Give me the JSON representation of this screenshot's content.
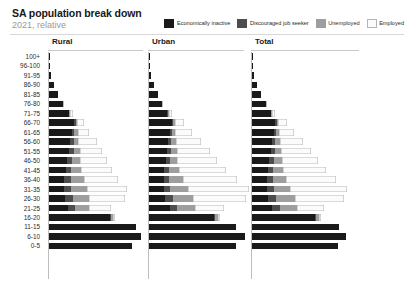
{
  "header": {
    "title": "SA population break down",
    "subtitle": "2021, relative"
  },
  "legend": {
    "items": [
      {
        "label": "Economically inactive",
        "color": "#1a1a1a",
        "icon": "legend-swatch-icon"
      },
      {
        "label": "Discouraged job seeker",
        "color": "#4d4d4d",
        "icon": "legend-swatch-icon"
      },
      {
        "label": "Unemployed",
        "color": "#9e9e9e",
        "icon": "legend-swatch-icon"
      },
      {
        "label": "Employed",
        "color": "#fbfbfb",
        "icon": "legend-swatch-icon"
      }
    ]
  },
  "panels": [
    {
      "key": "rural",
      "title": "Rural"
    },
    {
      "key": "urban",
      "title": "Urban"
    },
    {
      "key": "total",
      "title": "Total"
    }
  ],
  "chart_data": {
    "type": "bar",
    "subtype": "stacked-horizontal-population-pyramid",
    "title": "SA population break down",
    "subtitle": "2021, relative",
    "xlabel": "",
    "ylabel": "",
    "grid": false,
    "legend_position": "top-right",
    "stack_order": [
      "Economically inactive",
      "Discouraged job seeker",
      "Unemployed",
      "Employed"
    ],
    "series_colors": [
      "#1a1a1a",
      "#4d4d4d",
      "#9e9e9e",
      "#fbfbfb"
    ],
    "categories": [
      "100+",
      "96-100",
      "91-95",
      "86-90",
      "81-85",
      "76-80",
      "71-75",
      "66-70",
      "61-65",
      "56-60",
      "51-55",
      "46-50",
      "41-45",
      "36-40",
      "31-35",
      "26-30",
      "21-25",
      "16-20",
      "11-15",
      "6-10",
      "0-5"
    ],
    "panels": [
      {
        "name": "Rural",
        "values": {
          "Economically inactive": [
            0.4,
            0.6,
            1.2,
            3.2,
            5.6,
            8.6,
            12.2,
            15.6,
            14.2,
            13.2,
            12.6,
            11.4,
            10.2,
            9.4,
            9.2,
            9.6,
            11.8,
            37.4,
            54.0,
            56.6,
            51.0
          ],
          "Discouraged job seeker": [
            0,
            0,
            0,
            0,
            0,
            0,
            0.4,
            0.8,
            1.4,
            2.0,
            2.6,
            3.0,
            3.4,
            4.0,
            4.6,
            5.0,
            4.2,
            0.8,
            0,
            0,
            0
          ],
          "Unemployed": [
            0,
            0,
            0,
            0,
            0,
            0,
            0.4,
            1.0,
            2.0,
            3.0,
            4.0,
            5.0,
            6.4,
            8.0,
            9.4,
            10.2,
            9.0,
            1.4,
            0,
            0,
            0
          ],
          "Employed": [
            0,
            0,
            0,
            0,
            0,
            0.4,
            1.6,
            4.2,
            7.4,
            11.4,
            13.4,
            16.6,
            19.2,
            21.4,
            25.0,
            22.4,
            13.0,
            1.0,
            0,
            0,
            0
          ]
        }
      },
      {
        "name": "Urban",
        "values": {
          "Economically inactive": [
            0.4,
            0.6,
            1.2,
            3.0,
            5.4,
            8.2,
            11.4,
            14.0,
            13.0,
            12.0,
            11.2,
            10.2,
            9.4,
            9.0,
            9.0,
            9.6,
            13.0,
            40.0,
            54.0,
            59.0,
            54.0
          ],
          "Discouraged job seeker": [
            0,
            0,
            0,
            0,
            0,
            0,
            0.4,
            0.8,
            1.2,
            1.8,
            2.2,
            2.6,
            3.0,
            3.6,
            4.2,
            5.0,
            4.6,
            0.8,
            0,
            0,
            0
          ],
          "Unemployed": [
            0,
            0,
            0,
            0,
            0,
            0,
            0.4,
            1.0,
            2.0,
            2.8,
            3.8,
            4.8,
            6.2,
            8.2,
            10.6,
            12.6,
            11.0,
            1.6,
            0,
            0,
            0
          ],
          "Employed": [
            0,
            0,
            0,
            0,
            0,
            0.6,
            2.2,
            5.6,
            10.6,
            15.8,
            20.2,
            24.6,
            29.0,
            33.4,
            38.0,
            32.6,
            18.0,
            1.2,
            0,
            0,
            0
          ]
        }
      },
      {
        "name": "Total",
        "values": {
          "Economically inactive": [
            0.4,
            0.6,
            1.2,
            3.0,
            5.4,
            8.4,
            11.6,
            14.4,
            13.4,
            12.4,
            11.6,
            10.6,
            9.6,
            9.0,
            9.0,
            9.6,
            12.6,
            39.0,
            54.0,
            58.0,
            53.0
          ],
          "Discouraged job seeker": [
            0,
            0,
            0,
            0,
            0,
            0,
            0.4,
            0.8,
            1.2,
            1.8,
            2.4,
            2.8,
            3.2,
            3.8,
            4.4,
            5.0,
            4.4,
            0.8,
            0,
            0,
            0
          ],
          "Unemployed": [
            0,
            0,
            0,
            0,
            0,
            0,
            0.4,
            1.0,
            2.0,
            2.8,
            3.8,
            5.0,
            6.2,
            8.2,
            10.2,
            12.0,
            10.6,
            1.6,
            0,
            0,
            0
          ],
          "Employed": [
            0,
            0,
            0,
            0,
            0,
            0.6,
            2.0,
            5.2,
            9.6,
            14.4,
            18.4,
            22.6,
            26.6,
            30.6,
            35.0,
            30.0,
            16.6,
            1.2,
            0,
            0,
            0
          ]
        }
      }
    ]
  }
}
